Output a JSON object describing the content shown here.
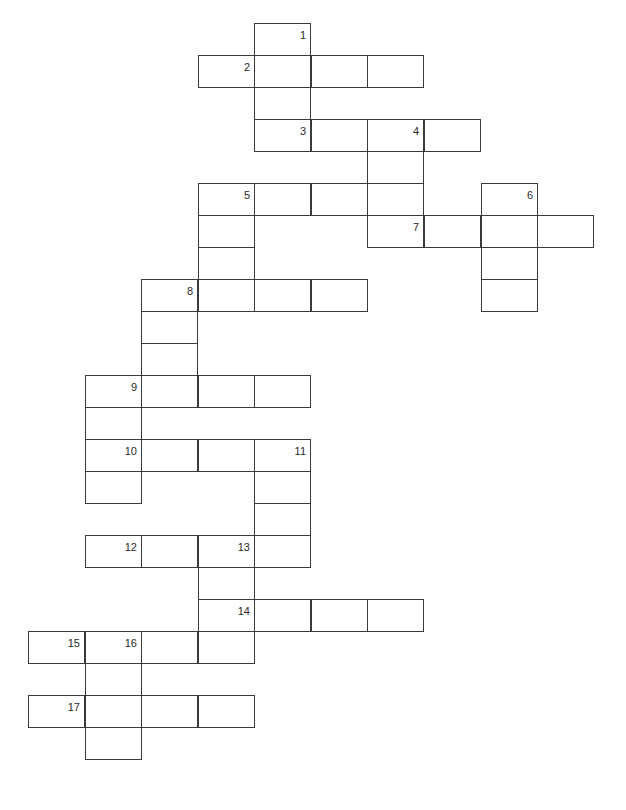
{
  "puzzle": {
    "type": "crossword",
    "layout": {
      "col_x": [
        28,
        85,
        141,
        198,
        254,
        311,
        367,
        424,
        481,
        537
      ],
      "row_y": [
        23,
        55,
        87,
        119,
        151,
        183,
        215,
        247,
        279,
        311,
        343,
        375,
        407,
        439,
        471,
        503,
        535,
        567,
        599,
        631,
        663,
        695,
        727
      ],
      "cell_w": 57,
      "cell_h": 33
    },
    "cells": [
      {
        "r": 0,
        "c": 4,
        "n": "1"
      },
      {
        "r": 1,
        "c": 3,
        "n": "2"
      },
      {
        "r": 1,
        "c": 4
      },
      {
        "r": 1,
        "c": 5
      },
      {
        "r": 1,
        "c": 6
      },
      {
        "r": 2,
        "c": 4
      },
      {
        "r": 3,
        "c": 4,
        "n": "3"
      },
      {
        "r": 3,
        "c": 5
      },
      {
        "r": 3,
        "c": 6,
        "n": "4"
      },
      {
        "r": 3,
        "c": 7
      },
      {
        "r": 4,
        "c": 6
      },
      {
        "r": 5,
        "c": 3,
        "n": "5"
      },
      {
        "r": 5,
        "c": 4
      },
      {
        "r": 5,
        "c": 5
      },
      {
        "r": 5,
        "c": 6
      },
      {
        "r": 5,
        "c": 8,
        "n": "6"
      },
      {
        "r": 6,
        "c": 3
      },
      {
        "r": 6,
        "c": 6,
        "n": "7"
      },
      {
        "r": 6,
        "c": 7
      },
      {
        "r": 6,
        "c": 8
      },
      {
        "r": 6,
        "c": 9
      },
      {
        "r": 7,
        "c": 3
      },
      {
        "r": 7,
        "c": 8
      },
      {
        "r": 8,
        "c": 2,
        "n": "8"
      },
      {
        "r": 8,
        "c": 3
      },
      {
        "r": 8,
        "c": 4
      },
      {
        "r": 8,
        "c": 5
      },
      {
        "r": 8,
        "c": 8
      },
      {
        "r": 9,
        "c": 2
      },
      {
        "r": 10,
        "c": 2
      },
      {
        "r": 11,
        "c": 1,
        "n": "9"
      },
      {
        "r": 11,
        "c": 2
      },
      {
        "r": 11,
        "c": 3
      },
      {
        "r": 11,
        "c": 4
      },
      {
        "r": 12,
        "c": 1
      },
      {
        "r": 13,
        "c": 1,
        "n": "10"
      },
      {
        "r": 13,
        "c": 2
      },
      {
        "r": 13,
        "c": 3
      },
      {
        "r": 13,
        "c": 4,
        "n": "11"
      },
      {
        "r": 14,
        "c": 1
      },
      {
        "r": 14,
        "c": 4
      },
      {
        "r": 15,
        "c": 4
      },
      {
        "r": 16,
        "c": 1,
        "n": "12"
      },
      {
        "r": 16,
        "c": 2
      },
      {
        "r": 16,
        "c": 3,
        "n": "13"
      },
      {
        "r": 16,
        "c": 4
      },
      {
        "r": 17,
        "c": 3
      },
      {
        "r": 18,
        "c": 3,
        "n": "14"
      },
      {
        "r": 18,
        "c": 4
      },
      {
        "r": 18,
        "c": 5
      },
      {
        "r": 18,
        "c": 6
      },
      {
        "r": 19,
        "c": 0,
        "n": "15"
      },
      {
        "r": 19,
        "c": 1,
        "n": "16"
      },
      {
        "r": 19,
        "c": 2
      },
      {
        "r": 19,
        "c": 3
      },
      {
        "r": 20,
        "c": 1
      },
      {
        "r": 21,
        "c": 0,
        "n": "17"
      },
      {
        "r": 21,
        "c": 1
      },
      {
        "r": 21,
        "c": 2
      },
      {
        "r": 21,
        "c": 3
      },
      {
        "r": 22,
        "c": 1
      }
    ],
    "clue_numbers": [
      "1",
      "2",
      "3",
      "4",
      "5",
      "6",
      "7",
      "8",
      "9",
      "10",
      "11",
      "12",
      "13",
      "14",
      "15",
      "16",
      "17"
    ]
  }
}
